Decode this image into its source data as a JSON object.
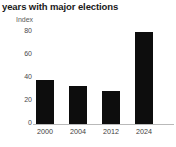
{
  "chart_data": {
    "type": "bar",
    "title": "years with major elections",
    "xlabel": "",
    "ylabel": "Index",
    "categories": [
      "2000",
      "2004",
      "2012",
      "2024"
    ],
    "values": [
      36,
      31,
      27,
      75
    ],
    "ylim": [
      0,
      80
    ],
    "yticks": [
      0,
      20,
      40,
      60,
      80
    ],
    "ytick_labels": [
      "0",
      "20",
      "40",
      "60",
      "80"
    ],
    "grid": false,
    "legend": "none",
    "bar_color": "#0d0d0d",
    "axis_color": "#b9b9b9",
    "background_color": "#ffffff"
  }
}
